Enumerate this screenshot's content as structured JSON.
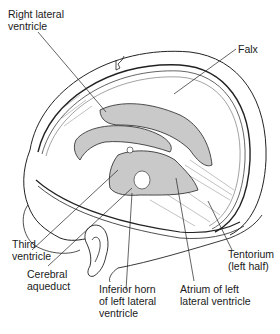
{
  "diagram": {
    "colors": {
      "ventricle_fill": "#c9c9c9",
      "line": "#222222",
      "background": "#ffffff"
    },
    "labels": {
      "right_lateral_ventricle": {
        "line1": "Right lateral",
        "line2": "ventricle"
      },
      "falx": {
        "line1": "Falx"
      },
      "third_ventricle": {
        "line1": "Third",
        "line2": "ventricle"
      },
      "cerebral_aqueduct": {
        "line1": "Cerebral",
        "line2": "aqueduct"
      },
      "inferior_horn": {
        "line1": "Inferior horn",
        "line2": "of left lateral",
        "line3": "ventricle"
      },
      "atrium": {
        "line1": "Atrium of left",
        "line2": "lateral ventricle"
      },
      "tentorium": {
        "line1": "Tentorium",
        "line2": "(left half)"
      }
    }
  }
}
